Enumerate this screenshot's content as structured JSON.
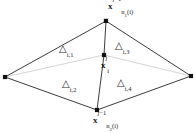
{
  "figure": {
    "width": 196,
    "height": 133,
    "background": "#ffffff",
    "edge_color_dark": "#3a3a3a",
    "edge_color_light": "#d0d0d0",
    "node_color": "#111111",
    "text_color": "#1a1a1a"
  },
  "nodes": [
    {
      "id": "top",
      "name": "node-top",
      "x": 106,
      "y": 21,
      "label_symbol": "x",
      "label_sub": "n",
      "label_sub_index": "1",
      "label_sub_arg": "(i)",
      "label_sup": "j−1",
      "label_full": "x_{n_1(i)}^{j-1}"
    },
    {
      "id": "left",
      "name": "node-left",
      "x": 5,
      "y": 77,
      "label_full": ""
    },
    {
      "id": "right",
      "name": "node-right",
      "x": 191,
      "y": 76,
      "label_full": ""
    },
    {
      "id": "center",
      "name": "node-center",
      "x": 104,
      "y": 55,
      "label_symbol": "x",
      "label_sub": "i",
      "label_sup": "j",
      "label_full": "x_i^j"
    },
    {
      "id": "bottom",
      "name": "node-bottom",
      "x": 97,
      "y": 110,
      "label_symbol": "x",
      "label_sub": "n",
      "label_sub_index": "2",
      "label_sub_arg": "(i)",
      "label_sup": "j−1",
      "label_full": "x_{n_2(i)}^{j-1}"
    }
  ],
  "edges": [
    {
      "name": "edge-left-top",
      "from": "left",
      "to": "top",
      "style": "dark"
    },
    {
      "name": "edge-top-right",
      "from": "top",
      "to": "right",
      "style": "dark"
    },
    {
      "name": "edge-right-bottom",
      "from": "right",
      "to": "bottom",
      "style": "dark"
    },
    {
      "name": "edge-bottom-left",
      "from": "bottom",
      "to": "left",
      "style": "dark"
    },
    {
      "name": "edge-top-center",
      "from": "top",
      "to": "center",
      "style": "dark"
    },
    {
      "name": "edge-center-bottom",
      "from": "center",
      "to": "bottom",
      "style": "dark"
    },
    {
      "name": "edge-left-center",
      "from": "left",
      "to": "center",
      "style": "light"
    },
    {
      "name": "edge-center-right",
      "from": "center",
      "to": "right",
      "style": "light"
    }
  ],
  "triangles": [
    {
      "id": "t1",
      "name": "triangle-label-i-1",
      "symbol": "△",
      "sub": "i,1",
      "x": 59,
      "y": 47
    },
    {
      "id": "t2",
      "name": "triangle-label-i-2",
      "symbol": "△",
      "sub": "i,2",
      "x": 62,
      "y": 82
    },
    {
      "id": "t3",
      "name": "triangle-label-i-3",
      "symbol": "△",
      "sub": "i,3",
      "x": 115,
      "y": 44
    },
    {
      "id": "t4",
      "name": "triangle-label-i-4",
      "symbol": "△",
      "sub": "i,4",
      "x": 117,
      "y": 81
    }
  ],
  "labels": {
    "top_symbol": "x",
    "top_sub_n": "n",
    "top_sub_n_index": "1",
    "top_sub_arg": "(i)",
    "top_sup": "j−1",
    "center_symbol": "x",
    "center_sub": "i",
    "center_sup": "j",
    "bottom_symbol": "x",
    "bottom_sub_n": "n",
    "bottom_sub_n_index": "2",
    "bottom_sub_arg": "(i)",
    "bottom_sup": "j−1",
    "tri1_symbol": "△",
    "tri1_sub": "i,1",
    "tri2_symbol": "△",
    "tri2_sub": "i,2",
    "tri3_symbol": "△",
    "tri3_sub": "i,3",
    "tri4_symbol": "△",
    "tri4_sub": "i,4"
  }
}
